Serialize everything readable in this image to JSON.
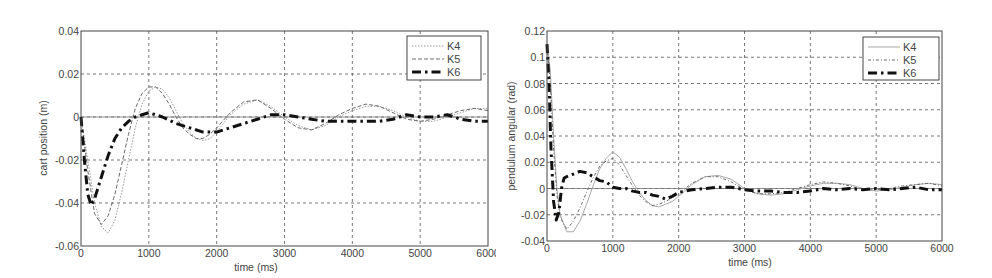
{
  "chart_data": [
    {
      "type": "line",
      "title": "",
      "xlabel": "time (ms)",
      "ylabel": "cart position (m)",
      "xlim": [
        0,
        6000
      ],
      "ylim": [
        -0.06,
        0.04
      ],
      "xticks": [
        "0",
        "1000",
        "2000",
        "3000",
        "4000",
        "5000",
        "6000"
      ],
      "yticks": [
        "0.04",
        "0.02",
        "0",
        "-0.02",
        "-0.04",
        "-0.06"
      ],
      "grid": true,
      "legend_position": "upper right",
      "series": [
        {
          "name": "K4",
          "style": "dotted-thin",
          "x": [
            0,
            100,
            200,
            300,
            400,
            500,
            600,
            700,
            800,
            900,
            1000,
            1100,
            1200,
            1300,
            1400,
            1500,
            1600,
            1700,
            1800,
            1900,
            2000,
            2200,
            2400,
            2600,
            2800,
            3000,
            3200,
            3400,
            3600,
            3800,
            4000,
            4200,
            4400,
            4600,
            4800,
            5000,
            5200,
            5400,
            5600,
            5800,
            6000
          ],
          "y": [
            0,
            -0.02,
            -0.04,
            -0.051,
            -0.054,
            -0.048,
            -0.035,
            -0.02,
            -0.005,
            0.006,
            0.012,
            0.014,
            0.013,
            0.009,
            0.003,
            -0.003,
            -0.007,
            -0.01,
            -0.011,
            -0.01,
            -0.007,
            0.001,
            0.006,
            0.008,
            0.005,
            0.0,
            -0.004,
            -0.006,
            -0.004,
            0.0,
            0.003,
            0.005,
            0.005,
            0.003,
            0.0,
            -0.002,
            -0.002,
            0.0,
            0.002,
            0.004,
            0.004
          ]
        },
        {
          "name": "K5",
          "style": "dashed-thin",
          "x": [
            0,
            100,
            200,
            300,
            400,
            500,
            600,
            700,
            800,
            900,
            1000,
            1100,
            1200,
            1300,
            1400,
            1500,
            1600,
            1700,
            1800,
            1900,
            2000,
            2200,
            2400,
            2600,
            2800,
            3000,
            3200,
            3400,
            3600,
            3800,
            4000,
            4200,
            4400,
            4600,
            4800,
            5000,
            5200,
            5400,
            5600,
            5800,
            6000
          ],
          "y": [
            0,
            -0.025,
            -0.045,
            -0.05,
            -0.046,
            -0.036,
            -0.022,
            -0.008,
            0.004,
            0.011,
            0.014,
            0.014,
            0.011,
            0.006,
            0.0,
            -0.005,
            -0.008,
            -0.01,
            -0.01,
            -0.008,
            -0.005,
            0.002,
            0.007,
            0.008,
            0.004,
            -0.001,
            -0.005,
            -0.006,
            -0.003,
            0.001,
            0.004,
            0.006,
            0.005,
            0.002,
            -0.001,
            -0.002,
            -0.001,
            0.001,
            0.003,
            0.004,
            0.003
          ]
        },
        {
          "name": "K6",
          "style": "dash-dot-thick",
          "x": [
            0,
            50,
            100,
            150,
            200,
            300,
            400,
            500,
            600,
            700,
            800,
            900,
            1000,
            1100,
            1200,
            1400,
            1600,
            1800,
            2000,
            2200,
            2400,
            2600,
            2800,
            3000,
            3200,
            3400,
            3600,
            3800,
            4000,
            4200,
            4400,
            4600,
            4800,
            5000,
            5200,
            5400,
            5600,
            5800,
            6000
          ],
          "y": [
            0,
            -0.02,
            -0.036,
            -0.041,
            -0.038,
            -0.028,
            -0.018,
            -0.01,
            -0.005,
            -0.002,
            0.0,
            0.001,
            0.002,
            0.001,
            0.0,
            -0.003,
            -0.005,
            -0.007,
            -0.007,
            -0.005,
            -0.003,
            -0.001,
            0.001,
            0.001,
            0.0,
            -0.001,
            -0.002,
            -0.002,
            -0.002,
            -0.002,
            -0.002,
            -0.001,
            0.001,
            0.0,
            0.0,
            0.001,
            -0.001,
            -0.002,
            -0.002
          ]
        }
      ]
    },
    {
      "type": "line",
      "title": "",
      "xlabel": "time (ms)",
      "ylabel": "pendulum angular (rad)",
      "xlim": [
        0,
        6000
      ],
      "ylim": [
        -0.04,
        0.12
      ],
      "xticks": [
        "0",
        "1000",
        "2000",
        "3000",
        "4000",
        "5000",
        "6000"
      ],
      "yticks": [
        "0.12",
        "0.1",
        "0.08",
        "0.06",
        "0.04",
        "0.02",
        "0",
        "-0.02",
        "-0.04"
      ],
      "grid": true,
      "legend_position": "upper right",
      "series": [
        {
          "name": "K4",
          "style": "solid-thin-light",
          "x": [
            0,
            50,
            100,
            150,
            200,
            300,
            400,
            500,
            600,
            700,
            800,
            900,
            1000,
            1100,
            1200,
            1300,
            1400,
            1500,
            1600,
            1700,
            1800,
            1900,
            2000,
            2200,
            2400,
            2600,
            2800,
            3000,
            3200,
            3400,
            3600,
            3800,
            4000,
            4200,
            4400,
            4600,
            4800,
            5000,
            5200,
            5400,
            5600,
            5800,
            6000
          ],
          "y": [
            0.11,
            0.09,
            0.04,
            0.0,
            -0.02,
            -0.033,
            -0.033,
            -0.025,
            -0.012,
            0.002,
            0.015,
            0.023,
            0.028,
            0.024,
            0.015,
            0.005,
            -0.003,
            -0.009,
            -0.013,
            -0.014,
            -0.012,
            -0.01,
            -0.006,
            0.003,
            0.009,
            0.01,
            0.007,
            0.0,
            -0.004,
            -0.005,
            -0.004,
            -0.001,
            0.002,
            0.004,
            0.004,
            0.003,
            0.0,
            -0.002,
            -0.001,
            0.001,
            0.003,
            0.004,
            0.003
          ]
        },
        {
          "name": "K5",
          "style": "dotted-dashed-thin",
          "x": [
            0,
            50,
            100,
            150,
            200,
            300,
            400,
            500,
            600,
            700,
            800,
            900,
            1000,
            1100,
            1200,
            1300,
            1400,
            1500,
            1600,
            1700,
            1800,
            1900,
            2000,
            2200,
            2400,
            2600,
            2800,
            3000,
            3200,
            3400,
            3600,
            3800,
            4000,
            4200,
            4400,
            4600,
            4800,
            5000,
            5200,
            5400,
            5600,
            5800,
            6000
          ],
          "y": [
            0.11,
            0.08,
            0.03,
            -0.005,
            -0.022,
            -0.031,
            -0.025,
            -0.015,
            -0.003,
            0.008,
            0.017,
            0.021,
            0.023,
            0.018,
            0.01,
            0.002,
            -0.005,
            -0.01,
            -0.013,
            -0.012,
            -0.01,
            -0.007,
            -0.004,
            0.004,
            0.009,
            0.009,
            0.005,
            -0.001,
            -0.004,
            -0.004,
            -0.003,
            0.0,
            0.003,
            0.005,
            0.004,
            0.002,
            -0.001,
            -0.001,
            0.0,
            0.002,
            0.003,
            0.004,
            0.002
          ]
        },
        {
          "name": "K6",
          "style": "dash-dot-thick",
          "x": [
            0,
            30,
            60,
            100,
            140,
            180,
            220,
            260,
            300,
            400,
            500,
            600,
            700,
            800,
            900,
            1000,
            1100,
            1200,
            1300,
            1400,
            1500,
            1600,
            1700,
            1800,
            1900,
            2000,
            2200,
            2400,
            2600,
            2800,
            3000,
            3200,
            3400,
            3600,
            3800,
            4000,
            4200,
            4400,
            4600,
            4800,
            5000,
            5200,
            5400,
            5600,
            5800,
            6000
          ],
          "y": [
            0.11,
            0.08,
            0.03,
            -0.01,
            -0.024,
            -0.018,
            0.0,
            0.008,
            0.009,
            0.011,
            0.013,
            0.012,
            0.009,
            0.006,
            0.005,
            0.001,
            0.0,
            0.0,
            -0.002,
            -0.003,
            -0.003,
            -0.005,
            -0.006,
            -0.008,
            -0.006,
            -0.003,
            -0.001,
            0.0,
            0.001,
            0.001,
            -0.001,
            -0.002,
            -0.002,
            -0.003,
            -0.003,
            -0.002,
            0.0,
            -0.001,
            0.0,
            -0.001,
            0.0,
            -0.001,
            0.0,
            0.001,
            -0.001,
            -0.001
          ]
        }
      ]
    }
  ],
  "charts": [
    {
      "xlabel": "time (ms)",
      "ylabel": "cart position (m)",
      "legend": [
        "K4",
        "K5",
        "K6"
      ]
    },
    {
      "xlabel": "time (ms)",
      "ylabel": "pendulum angular (rad)",
      "legend": [
        "K4",
        "K5",
        "K6"
      ]
    }
  ]
}
